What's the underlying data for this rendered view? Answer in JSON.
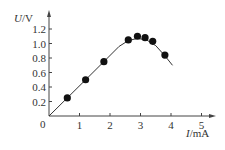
{
  "chart_data": {
    "type": "scatter",
    "title": "",
    "xlabel": "I/mA",
    "ylabel": "U/V",
    "xlabel_var": "I",
    "xlabel_unit": "/mA",
    "ylabel_var": "U",
    "ylabel_unit": "/V",
    "xlim": [
      0,
      5.6
    ],
    "ylim": [
      0,
      1.3
    ],
    "x_ticks": [
      "1",
      "2",
      "3",
      "4",
      "5"
    ],
    "y_ticks": [
      "0.2",
      "0.4",
      "0.6",
      "0.8",
      "1.0",
      "1.2"
    ],
    "origin_label": "0",
    "grid": false,
    "legend": null,
    "series": [
      {
        "name": "measured points",
        "x": [
          0.6,
          1.2,
          1.8,
          2.6,
          2.9,
          3.15,
          3.4,
          3.8
        ],
        "y": [
          0.25,
          0.5,
          0.75,
          1.05,
          1.1,
          1.08,
          1.03,
          0.84
        ]
      },
      {
        "name": "fitted curve",
        "x": [
          0,
          0.6,
          1.2,
          1.8,
          2.3,
          2.6,
          2.9,
          3.2,
          3.5,
          3.8,
          4.05
        ],
        "y": [
          0,
          0.25,
          0.5,
          0.75,
          0.96,
          1.04,
          1.07,
          1.05,
          0.97,
          0.83,
          0.7
        ]
      }
    ]
  }
}
